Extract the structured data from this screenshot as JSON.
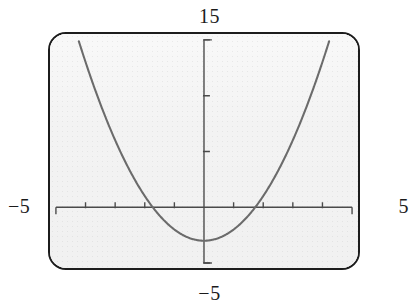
{
  "figure": {
    "kind": "graphing-calculator-screen",
    "frame_color": "#1c1c1c",
    "screen_background": "#f1f1f1",
    "curve_color": "#6b6b6b",
    "axis_color": "#4a4a4a"
  },
  "labels": {
    "top": "15",
    "bottom": "−5",
    "left": "−5",
    "right": "5"
  },
  "chart_data": {
    "type": "line",
    "title": "",
    "xlabel": "",
    "ylabel": "",
    "xlim": [
      -5,
      5
    ],
    "ylim": [
      -5,
      15
    ],
    "grid": false,
    "legend": null,
    "axis_end_labels": {
      "xmin": "−5",
      "xmax": "5",
      "ymin": "−5",
      "ymax": "15"
    },
    "xticks": [
      -4,
      -3,
      -2,
      -1,
      1,
      2,
      3,
      4
    ],
    "yticks": [
      -5,
      5,
      10,
      15
    ],
    "xtick_labels": [],
    "ytick_labels": [],
    "series": [
      {
        "name": "parabola",
        "equation": "y = x^2 - 3",
        "vertex": [
          0,
          -3
        ],
        "roots": [
          -1.73,
          1.73
        ],
        "x": [
          -4.24,
          -4.0,
          -3.5,
          -3.0,
          -2.5,
          -2.0,
          -1.73,
          -1.5,
          -1.0,
          -0.5,
          0.0,
          0.5,
          1.0,
          1.5,
          1.73,
          2.0,
          2.5,
          3.0,
          3.5,
          4.0,
          4.24
        ],
        "values": [
          15.0,
          13.0,
          9.25,
          6.0,
          3.25,
          1.0,
          0.0,
          -0.75,
          -2.0,
          -2.75,
          -3.0,
          -2.75,
          -2.0,
          -0.75,
          0.0,
          1.0,
          3.25,
          6.0,
          9.25,
          13.0,
          15.0
        ]
      }
    ]
  }
}
